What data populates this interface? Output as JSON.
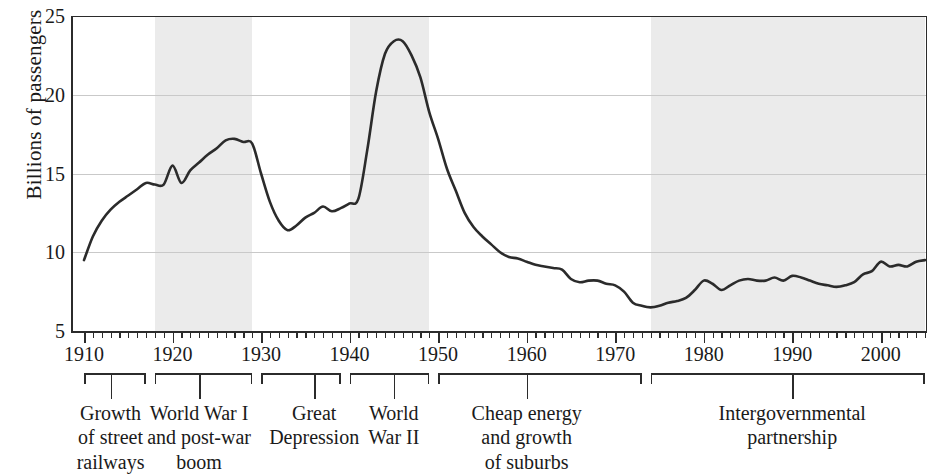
{
  "chart_data": {
    "type": "line",
    "title": "",
    "xlabel": "",
    "ylabel": "Billions of passengers",
    "xlim": [
      1910,
      2005
    ],
    "ylim": [
      5,
      25
    ],
    "yticks": [
      5,
      10,
      15,
      20,
      25
    ],
    "xticks": [
      1910,
      1920,
      1930,
      1940,
      1950,
      1960,
      1970,
      1980,
      1990,
      2000
    ],
    "grid": true,
    "legend": "none",
    "line_color": "#2b2b2b",
    "band_color": "#ebebeb",
    "x": [
      1910,
      1911,
      1912,
      1913,
      1914,
      1915,
      1916,
      1917,
      1918,
      1919,
      1920,
      1921,
      1922,
      1923,
      1924,
      1925,
      1926,
      1927,
      1928,
      1929,
      1930,
      1931,
      1932,
      1933,
      1934,
      1935,
      1936,
      1937,
      1938,
      1939,
      1940,
      1941,
      1942,
      1943,
      1944,
      1945,
      1946,
      1947,
      1948,
      1949,
      1950,
      1951,
      1952,
      1953,
      1954,
      1955,
      1956,
      1957,
      1958,
      1959,
      1960,
      1961,
      1962,
      1963,
      1964,
      1965,
      1966,
      1967,
      1968,
      1969,
      1970,
      1971,
      1972,
      1973,
      1974,
      1975,
      1976,
      1977,
      1978,
      1979,
      1980,
      1981,
      1982,
      1983,
      1984,
      1985,
      1986,
      1987,
      1988,
      1989,
      1990,
      1991,
      1992,
      1993,
      1994,
      1995,
      1996,
      1997,
      1998,
      1999,
      2000,
      2001,
      2002,
      2003,
      2004,
      2005
    ],
    "values": [
      9.5,
      11.0,
      12.0,
      12.7,
      13.2,
      13.6,
      14.0,
      14.4,
      14.3,
      14.3,
      15.5,
      14.4,
      15.2,
      15.7,
      16.2,
      16.6,
      17.1,
      17.2,
      17.0,
      16.9,
      15.0,
      13.2,
      12.0,
      11.4,
      11.7,
      12.2,
      12.5,
      12.9,
      12.6,
      12.8,
      13.1,
      13.4,
      16.5,
      20.2,
      22.6,
      23.4,
      23.4,
      22.5,
      21.1,
      18.9,
      17.2,
      15.3,
      13.9,
      12.5,
      11.6,
      11.0,
      10.5,
      10.0,
      9.7,
      9.6,
      9.4,
      9.2,
      9.1,
      9.0,
      8.9,
      8.3,
      8.1,
      8.2,
      8.2,
      8.0,
      7.9,
      7.5,
      6.8,
      6.6,
      6.5,
      6.6,
      6.8,
      6.9,
      7.1,
      7.6,
      8.2,
      8.0,
      7.6,
      7.9,
      8.2,
      8.3,
      8.2,
      8.2,
      8.4,
      8.2,
      8.5,
      8.4,
      8.2,
      8.0,
      7.9,
      7.8,
      7.9,
      8.1,
      8.6,
      8.8,
      9.4,
      9.1,
      9.2,
      9.1,
      9.4,
      9.5
    ],
    "bands": [
      {
        "label": "World War I and post-war boom",
        "start": 1918,
        "end": 1929
      },
      {
        "label": "World War II",
        "start": 1940,
        "end": 1949
      },
      {
        "label": "Intergovernmental partnership",
        "start": 1974,
        "end": 2005
      }
    ],
    "periods": [
      {
        "lines": [
          "Growth",
          "of street",
          "railways"
        ],
        "start": 1910,
        "end": 1917,
        "mark": 1913
      },
      {
        "lines": [
          "World War I",
          "and post-war",
          "boom"
        ],
        "start": 1918,
        "end": 1929,
        "mark": 1923
      },
      {
        "lines": [
          "Great",
          "Depression"
        ],
        "start": 1930,
        "end": 1939,
        "mark": 1936
      },
      {
        "lines": [
          "World",
          "War II"
        ],
        "start": 1940,
        "end": 1949,
        "mark": 1945
      },
      {
        "lines": [
          "Cheap energy",
          "and growth",
          "of suburbs"
        ],
        "start": 1950,
        "end": 1973,
        "mark": 1960
      },
      {
        "lines": [
          "Intergovernmental",
          "partnership"
        ],
        "start": 1974,
        "end": 2005,
        "mark": 1990
      }
    ]
  }
}
